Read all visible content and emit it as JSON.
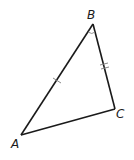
{
  "diagram": {
    "type": "triangle",
    "vertices": [
      {
        "label": "A",
        "x": 21,
        "y": 135
      },
      {
        "label": "B",
        "x": 93,
        "y": 24
      },
      {
        "label": "C",
        "x": 115,
        "y": 109
      }
    ],
    "tick_marks": {
      "AB": 1,
      "BC": 2
    },
    "angle_marks": [
      "B"
    ],
    "stroke_color": "#1a1a1a",
    "tick_color": "#888888"
  }
}
